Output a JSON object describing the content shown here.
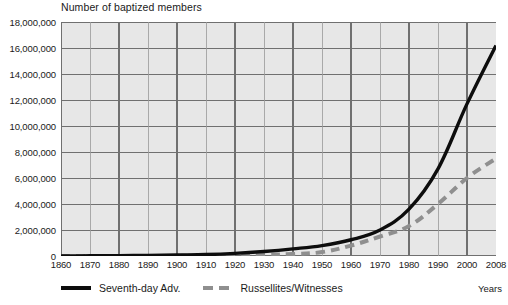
{
  "chart_data": {
    "type": "line",
    "title": "Number of baptized members",
    "xlabel": "Years",
    "ylabel": "",
    "grid": true,
    "legend_position": "bottom",
    "xlim": [
      1860,
      2008
    ],
    "ylim": [
      0,
      18000000
    ],
    "x_ticks": [
      "1860",
      "1870",
      "1880",
      "1890",
      "1900",
      "1910",
      "1920",
      "1930",
      "1940",
      "1950",
      "1960",
      "1970",
      "1980",
      "1990",
      "2000",
      "2008"
    ],
    "y_ticks": [
      "0",
      "2,000,000",
      "4,000,000",
      "6,000,000",
      "8,000,000",
      "10,000,000",
      "12,000,000",
      "14,000,000",
      "16,000,000",
      "18,000,000"
    ],
    "y_tick_values": [
      0,
      2000000,
      4000000,
      6000000,
      8000000,
      10000000,
      12000000,
      14000000,
      16000000,
      18000000
    ],
    "x": [
      1860,
      1870,
      1880,
      1890,
      1900,
      1910,
      1920,
      1930,
      1940,
      1950,
      1960,
      1970,
      1980,
      1990,
      2000,
      2008
    ],
    "series": [
      {
        "name": "Seventh-day Adv.",
        "style": "solid",
        "color": "#0d0d0d",
        "values": [
          0,
          15000,
          30000,
          50000,
          80000,
          110000,
          200000,
          350000,
          550000,
          800000,
          1250000,
          2000000,
          3600000,
          6700000,
          11700000,
          16200000
        ]
      },
      {
        "name": "Russellites/Witnesses",
        "style": "dashed",
        "color": "#8f8f8f",
        "values": [
          0,
          0,
          0,
          5000,
          10000,
          20000,
          40000,
          80000,
          150000,
          300000,
          800000,
          1500000,
          2300000,
          4000000,
          6000000,
          7500000
        ]
      }
    ]
  },
  "legend": [
    {
      "label": "Seventh-day Adv.",
      "style": "solid",
      "swatch": "solid-line-swatch"
    },
    {
      "label": "Russellites/Witnesses",
      "style": "dashed",
      "swatch": "dashed-line-swatch"
    }
  ],
  "axis_caption": {
    "years": "Years"
  },
  "colors": {
    "plot_background": "#e7e7e7",
    "gridline_major": "#707070",
    "gridline_minor": "#9a9a9a",
    "series_primary": "#0d0d0d",
    "series_secondary": "#8f8f8f",
    "text": "#1a1a1a"
  }
}
